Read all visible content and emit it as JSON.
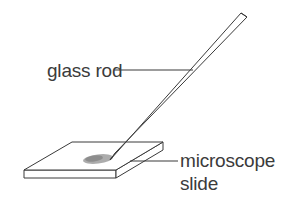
{
  "figure": {
    "background_color": "#ffffff",
    "line_color": "#3a3a3a",
    "text_color": "#3b3b3b",
    "stain_color": "#9a9a9a",
    "width": 302,
    "height": 205
  },
  "labels": {
    "glass_rod": "glass rod",
    "microscope": "microscope",
    "slide": "slide"
  },
  "parts": {
    "rod_name": "glass-rod",
    "slide_name": "microscope-slide",
    "stain_name": "liquid-stain"
  }
}
